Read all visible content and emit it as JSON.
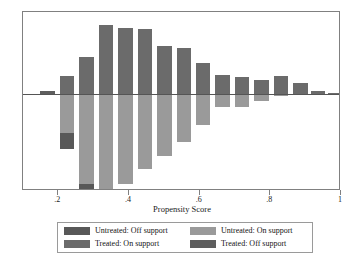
{
  "chart_data": {
    "type": "bar",
    "title": "",
    "xlabel": "Propensity Score",
    "ylabel": "",
    "xlim": [
      0.1,
      1.0
    ],
    "ylim": [
      -1.0,
      1.0
    ],
    "grid": false,
    "orientation": "back-to-back histogram",
    "xticks": [
      ".2",
      ".4",
      ".6",
      ".8",
      "1"
    ],
    "xtick_values": [
      0.2,
      0.4,
      0.6,
      0.8,
      1.0
    ],
    "legend_position": "below-axis",
    "note": "Treated density plotted upward, untreated density plotted downward; off-support mass shown in darker shade",
    "bins": [
      {
        "x": 0.17,
        "treated_on": 0.0,
        "treated_off": 0.035,
        "untreated_on": 0.0,
        "untreated_off": 0.0
      },
      {
        "x": 0.225,
        "treated_on": 0.24,
        "treated_off": 0.0,
        "untreated_on": 0.43,
        "untreated_off": 0.185
      },
      {
        "x": 0.28,
        "treated_on": 0.5,
        "treated_off": 0.0,
        "untreated_on": 1.0,
        "untreated_off": 0.055
      },
      {
        "x": 0.335,
        "treated_on": 0.93,
        "treated_off": 0.0,
        "untreated_on": 1.06,
        "untreated_off": 0.0
      },
      {
        "x": 0.39,
        "treated_on": 0.895,
        "treated_off": 0.0,
        "untreated_on": 1.0,
        "untreated_off": 0.0
      },
      {
        "x": 0.445,
        "treated_on": 0.885,
        "treated_off": 0.0,
        "untreated_on": 0.83,
        "untreated_off": 0.0
      },
      {
        "x": 0.5,
        "treated_on": 0.65,
        "treated_off": 0.0,
        "untreated_on": 0.69,
        "untreated_off": 0.0
      },
      {
        "x": 0.555,
        "treated_on": 0.62,
        "treated_off": 0.0,
        "untreated_on": 0.535,
        "untreated_off": 0.0
      },
      {
        "x": 0.61,
        "treated_on": 0.425,
        "treated_off": 0.0,
        "untreated_on": 0.345,
        "untreated_off": 0.0
      },
      {
        "x": 0.665,
        "treated_on": 0.26,
        "treated_off": 0.0,
        "untreated_on": 0.145,
        "untreated_off": 0.0
      },
      {
        "x": 0.72,
        "treated_on": 0.225,
        "treated_off": 0.0,
        "untreated_on": 0.14,
        "untreated_off": 0.0
      },
      {
        "x": 0.775,
        "treated_on": 0.19,
        "treated_off": 0.0,
        "untreated_on": 0.075,
        "untreated_off": 0.0
      },
      {
        "x": 0.83,
        "treated_on": 0.25,
        "treated_off": 0.0,
        "untreated_on": 0.025,
        "untreated_off": 0.0
      },
      {
        "x": 0.885,
        "treated_on": 0.145,
        "treated_off": 0.0,
        "untreated_on": 0.0,
        "untreated_off": 0.0
      },
      {
        "x": 0.935,
        "treated_on": 0.035,
        "treated_off": 0.0,
        "untreated_on": 0.0,
        "untreated_off": 0.0
      },
      {
        "x": 0.985,
        "treated_on": 0.012,
        "treated_off": 0.0,
        "untreated_on": 0.0,
        "untreated_off": 0.0
      }
    ]
  },
  "legend": {
    "items": [
      {
        "label": "Untreated: Off support",
        "color": "#585858",
        "name": "untreated-off-support"
      },
      {
        "label": "Untreated: On support",
        "color": "#9a9a9a",
        "name": "untreated-on-support"
      },
      {
        "label": "Treated: On support",
        "color": "#6b6b6b",
        "name": "treated-on-support"
      },
      {
        "label": "Treated: Off support",
        "color": "#5e5e5e",
        "name": "treated-off-support"
      }
    ]
  },
  "colors": {
    "treated_on": "#6b6b6b",
    "treated_off": "#5e5e5e",
    "untreated_on": "#9a9a9a",
    "untreated_off": "#585858",
    "frame": "#808080",
    "zero_line": "#555555",
    "text": "#141414",
    "background": "#ffffff"
  }
}
